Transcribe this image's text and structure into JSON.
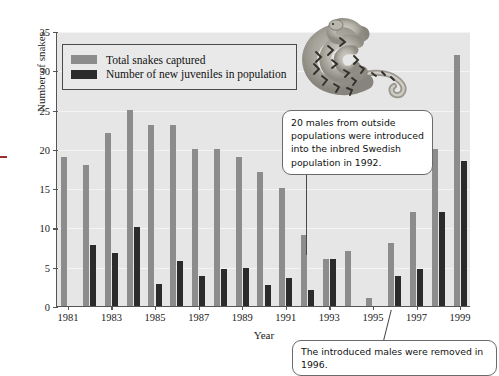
{
  "chart_data": {
    "type": "bar",
    "title": "",
    "xlabel": "Year",
    "ylabel": "Number of snakes",
    "ylim": [
      0,
      35
    ],
    "yticks": [
      0,
      5,
      10,
      15,
      20,
      25,
      30,
      35
    ],
    "xticks": [
      1981,
      1983,
      1985,
      1987,
      1989,
      1991,
      1993,
      1995,
      1997,
      1999
    ],
    "grid": true,
    "legend_position": "top-left",
    "categories": [
      1981,
      1982,
      1983,
      1984,
      1985,
      1986,
      1987,
      1988,
      1989,
      1990,
      1991,
      1992,
      1993,
      1994,
      1995,
      1996,
      1997,
      1998,
      1999
    ],
    "series": [
      {
        "name": "Total snakes captured",
        "color": "#8c8c8c",
        "values": [
          19,
          18,
          22,
          25,
          23,
          23,
          20,
          20,
          19,
          17,
          15,
          9,
          6,
          7,
          1,
          8,
          12,
          20,
          32
        ]
      },
      {
        "name": "Number of new juveniles in population",
        "color": "#2b2b2b",
        "values": [
          0,
          7.8,
          6.8,
          10,
          2.8,
          5.7,
          3.8,
          4.7,
          4.9,
          2.7,
          3.6,
          2,
          6,
          0,
          0,
          3.8,
          4.7,
          12,
          18.5
        ]
      }
    ],
    "annotations": [
      {
        "id": "introduced",
        "text": "20 males from outside populations were introduced into the inbred Swedish population in 1992.",
        "points_to_year": 1992
      },
      {
        "id": "removed",
        "text": "The introduced males were removed in 1996.",
        "points_to_year": 1996
      }
    ],
    "illustration": "coiled-adder-snake"
  },
  "legend": {
    "items": [
      {
        "label": "Total snakes captured",
        "swatch": "total"
      },
      {
        "label": "Number of new juveniles in population",
        "swatch": "juv"
      }
    ]
  },
  "axes": {
    "y_label": "Number of snakes",
    "x_label": "Year",
    "y_ticks": [
      "0",
      "5",
      "10",
      "15",
      "20",
      "25",
      "30",
      "35"
    ],
    "x_ticks": [
      "1981",
      "1983",
      "1985",
      "1987",
      "1989",
      "1991",
      "1993",
      "1995",
      "1997",
      "1999"
    ]
  },
  "callouts": {
    "introduced": "20 males from outside populations were introduced into the inbred Swedish population in 1992.",
    "removed": "The introduced males were removed in 1996."
  },
  "colors": {
    "plot_background": "#e6e6e6",
    "total_bar": "#8c8c8c",
    "juvenile_bar": "#2b2b2b",
    "axis": "#555555",
    "gridline": "#f4f4f4"
  }
}
